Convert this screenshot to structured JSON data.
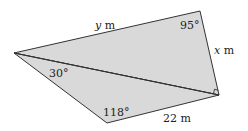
{
  "diagram": {
    "type": "quadrilateral-split-into-two-triangles",
    "fill_color": "#d9d9d9",
    "stroke_color": "#333333",
    "vertices": {
      "left": [
        14,
        53
      ],
      "top_right": [
        200,
        11
      ],
      "right": [
        219,
        95
      ],
      "bottom": [
        107,
        123
      ]
    },
    "diagonal": [
      "left",
      "right"
    ],
    "right_angle_at": "right",
    "labels": {
      "side_top": {
        "var": "y",
        "unit": " m"
      },
      "side_right": {
        "var": "x",
        "unit": " m"
      },
      "side_bottom": "22 m",
      "angle_top_right": "95°",
      "angle_left_lower": "30°",
      "angle_bottom": "118°"
    }
  }
}
